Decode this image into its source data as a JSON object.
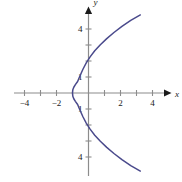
{
  "chart_data": {
    "type": "line",
    "title": "",
    "subtitle": "",
    "xlabel": "x",
    "ylabel": "y",
    "xlim": [
      -5,
      5
    ],
    "ylim": [
      -5.2,
      5.2
    ],
    "grid": false,
    "legend": "none",
    "curve_color": "#4a4a8c",
    "axis_color": "#8c8c8c",
    "background_color": "#ffffff",
    "equation": "x = y^2/4 - 1",
    "vertex": [
      -1,
      0
    ],
    "opens": "right",
    "x_ticks": [
      -4,
      -3,
      -2,
      -1,
      1,
      2,
      3,
      4
    ],
    "y_ticks": [
      -4,
      -3,
      -2,
      -1,
      1,
      2,
      3,
      4
    ],
    "x_tick_labels": [
      {
        "value": -4,
        "text": "−4"
      },
      {
        "value": -2,
        "text": "−2"
      },
      {
        "value": 2,
        "text": "2"
      },
      {
        "value": 4,
        "text": "4"
      }
    ],
    "y_tick_labels": [
      {
        "value": 4,
        "text": "4"
      },
      {
        "value": 1,
        "text": "1"
      },
      {
        "value": -1,
        "text": "1"
      },
      {
        "value": -4,
        "text": "4"
      }
    ],
    "x_axis_arrow": true,
    "y_axis_arrow": true,
    "series": [
      {
        "name": "parabola",
        "points": [
          [
            3.24,
            -4.88
          ],
          [
            2.64,
            -4.54
          ],
          [
            2.09,
            -4.16
          ],
          [
            1.59,
            -3.78
          ],
          [
            1.14,
            -3.4
          ],
          [
            0.74,
            -3.02
          ],
          [
            0.39,
            -2.64
          ],
          [
            0.1,
            -2.26
          ],
          [
            -0.14,
            -1.88
          ],
          [
            -0.34,
            -1.5
          ],
          [
            -0.53,
            -1.08
          ],
          [
            -0.68,
            -0.72
          ],
          [
            -0.82,
            -0.52
          ],
          [
            -0.92,
            -0.36
          ],
          [
            -0.98,
            -0.2
          ],
          [
            -1.0,
            0.0
          ],
          [
            -0.98,
            0.2
          ],
          [
            -0.92,
            0.36
          ],
          [
            -0.82,
            0.52
          ],
          [
            -0.68,
            0.72
          ],
          [
            -0.53,
            1.08
          ],
          [
            -0.34,
            1.5
          ],
          [
            -0.14,
            1.88
          ],
          [
            0.1,
            2.26
          ],
          [
            0.39,
            2.64
          ],
          [
            0.74,
            3.02
          ],
          [
            1.14,
            3.4
          ],
          [
            1.59,
            3.78
          ],
          [
            2.09,
            4.16
          ],
          [
            2.64,
            4.54
          ],
          [
            3.24,
            4.88
          ]
        ]
      }
    ]
  },
  "axis_labels": {
    "x": "x",
    "y": "y"
  }
}
